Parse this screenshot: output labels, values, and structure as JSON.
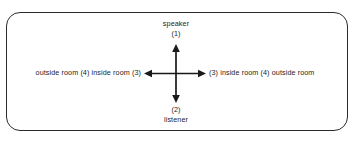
{
  "figure": {
    "type": "direction-diagram",
    "frame": {
      "shape": "rounded-rectangle",
      "border_color": "#2b2b2b"
    },
    "labels": {
      "top_name": "speaker",
      "top_index": "(1)",
      "bottom_index": "(2)",
      "bottom_name": "listener",
      "left_text": "outside room (4) inside room (3)",
      "right_text": "(3) inside room (4) outside room"
    },
    "arrows": {
      "up": "arrow-up",
      "down": "arrow-down",
      "left": "arrow-left",
      "right": "arrow-right",
      "color": "#1a1a1a"
    }
  }
}
